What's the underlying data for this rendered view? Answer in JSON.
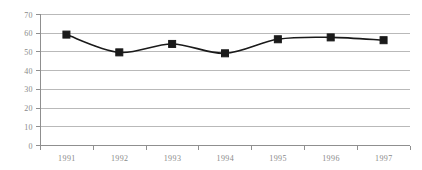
{
  "chart_data": {
    "type": "line",
    "title": "",
    "subtitle": "",
    "xlabel": "",
    "ylabel": "",
    "categories": [
      "1991",
      "1992",
      "1993",
      "1994",
      "1995",
      "1996",
      "1997"
    ],
    "series": [
      {
        "name": "Series 1",
        "values": [
          59,
          49.5,
          54,
          49,
          56.5,
          57.5,
          56
        ],
        "color": "#1a1a1a",
        "marker": "square"
      }
    ],
    "ylim": [
      0,
      70
    ],
    "ytick_values": [
      0,
      10,
      20,
      30,
      40,
      50,
      60,
      70
    ],
    "ytick_labels": [
      "0",
      "10",
      "20",
      "30",
      "40",
      "50",
      "60",
      "70"
    ],
    "xtick_labels": [
      "1991",
      "1992",
      "1993",
      "1994",
      "1995",
      "1996",
      "1997"
    ],
    "grid": {
      "horizontal": true,
      "vertical": false,
      "color": "#b9b9b9"
    },
    "legend": {
      "visible": false,
      "position": "none",
      "entries": []
    },
    "axis": {
      "x_axis_color": "#8f8f8f",
      "y_axis_color": "#8f8f8f",
      "tick_label_color": "#8a8a8a"
    },
    "plot_area": {
      "left": 40,
      "right": 410,
      "top": 14,
      "bottom": 145
    },
    "annotations": []
  }
}
